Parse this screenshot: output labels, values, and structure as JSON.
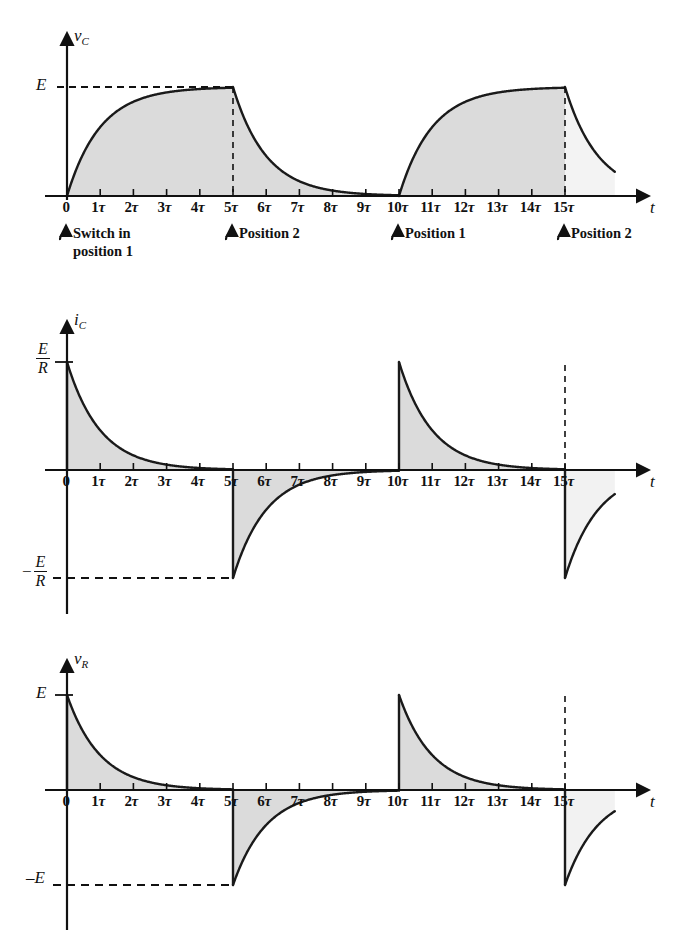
{
  "figure": {
    "title": "",
    "colors": {
      "curve": "#1a1a1a",
      "axis": "#111111",
      "fill": "#d9d9d9",
      "fill_light": "#e8e8e8",
      "dashed": "#111111"
    },
    "tau_labels": [
      "0",
      "1τ",
      "2τ",
      "3τ",
      "4τ",
      "5τ",
      "6τ",
      "7τ",
      "8τ",
      "9τ",
      "10τ",
      "11τ",
      "12τ",
      "13τ",
      "14τ",
      "15τ"
    ],
    "time_axis_label": "t"
  },
  "panels": [
    {
      "id": "vc",
      "y_axis_label": "v",
      "y_axis_sub": "C",
      "y_levels": [
        {
          "label": "E",
          "value": 1.0
        }
      ],
      "x_tick_labels": [
        "0",
        "1τ",
        "2τ",
        "3τ",
        "4τ",
        "5τ",
        "6τ",
        "7τ",
        "8τ",
        "9τ",
        "10τ",
        "11τ",
        "12τ",
        "13τ",
        "14τ",
        "15τ"
      ],
      "x_axis_label": "t",
      "annotations": [
        {
          "at_tau": 0,
          "line1": "Switch in",
          "line2": "position 1"
        },
        {
          "at_tau": 5,
          "line1": "Position 2",
          "line2": ""
        },
        {
          "at_tau": 10,
          "line1": "Position 1",
          "line2": ""
        },
        {
          "at_tau": 15,
          "line1": "Position 2",
          "line2": ""
        }
      ]
    },
    {
      "id": "ic",
      "y_axis_label": "i",
      "y_axis_sub": "C",
      "y_levels": [
        {
          "label_num": "E",
          "label_den": "R",
          "sign": "",
          "value": 1.0
        },
        {
          "label_num": "E",
          "label_den": "R",
          "sign": "−",
          "value": -1.0
        }
      ],
      "x_tick_labels": [
        "0",
        "1τ",
        "2τ",
        "3τ",
        "4τ",
        "5τ",
        "6τ",
        "7τ",
        "8τ",
        "9τ",
        "10τ",
        "11τ",
        "12τ",
        "13τ",
        "14τ",
        "15τ"
      ],
      "x_axis_label": "t",
      "annotations": []
    },
    {
      "id": "vr",
      "y_axis_label": "v",
      "y_axis_sub": "R",
      "y_levels": [
        {
          "label": "E",
          "value": 1.0
        },
        {
          "label": "–E",
          "value": -1.0
        }
      ],
      "x_tick_labels": [
        "0",
        "1τ",
        "2τ",
        "3τ",
        "4τ",
        "5τ",
        "6τ",
        "7τ",
        "8τ",
        "9τ",
        "10τ",
        "11τ",
        "12τ",
        "13τ",
        "14τ",
        "15τ"
      ],
      "x_axis_label": "t",
      "annotations": []
    }
  ],
  "chart_data": {
    "type": "line",
    "xlabel": "t",
    "x_unit": "tau",
    "xlim": [
      -0.6,
      17.5
    ],
    "grid": false,
    "legend": "none",
    "x_ticks": [
      0,
      1,
      2,
      3,
      4,
      5,
      6,
      7,
      8,
      9,
      10,
      11,
      12,
      13,
      14,
      15
    ],
    "x_tick_labels": [
      "0",
      "1τ",
      "2τ",
      "3τ",
      "4τ",
      "5τ",
      "6τ",
      "7τ",
      "8τ",
      "9τ",
      "10τ",
      "11τ",
      "12τ",
      "13τ",
      "14τ",
      "15τ"
    ],
    "series": [
      {
        "name": "v_C",
        "ylabel": "v_C",
        "ylim": [
          0,
          1.08
        ],
        "y_tick_labels": [
          "E"
        ],
        "y_ticks": [
          1.0
        ],
        "segments": [
          {
            "range_tau": [
              0,
              5
            ],
            "formula": "E*(1-exp(-t/tau))",
            "start_value": 0.0,
            "end_value": 1.0
          },
          {
            "range_tau": [
              5,
              10
            ],
            "formula": "E*exp(-(t-5)/tau)",
            "start_value": 1.0,
            "end_value": 0.0
          },
          {
            "range_tau": [
              10,
              15
            ],
            "formula": "E*(1-exp(-(t-10)/tau))",
            "start_value": 0.0,
            "end_value": 1.0
          },
          {
            "range_tau": [
              15,
              16.5
            ],
            "formula": "E*exp(-(t-15)/tau)",
            "start_value": 1.0,
            "end_value": 0.22
          }
        ],
        "sample_points": [
          {
            "t": 0,
            "v": 0.0
          },
          {
            "t": 1,
            "v": 0.632
          },
          {
            "t": 2,
            "v": 0.865
          },
          {
            "t": 3,
            "v": 0.95
          },
          {
            "t": 4,
            "v": 0.982
          },
          {
            "t": 5,
            "v": 1.0
          },
          {
            "t": 6,
            "v": 0.368
          },
          {
            "t": 7,
            "v": 0.135
          },
          {
            "t": 8,
            "v": 0.05
          },
          {
            "t": 9,
            "v": 0.018
          },
          {
            "t": 10,
            "v": 0.0
          },
          {
            "t": 11,
            "v": 0.632
          },
          {
            "t": 12,
            "v": 0.865
          },
          {
            "t": 13,
            "v": 0.95
          },
          {
            "t": 14,
            "v": 0.982
          },
          {
            "t": 15,
            "v": 1.0
          },
          {
            "t": 16,
            "v": 0.368
          }
        ]
      },
      {
        "name": "i_C",
        "ylabel": "i_C",
        "ylim": [
          -1.08,
          1.08
        ],
        "y_tick_labels": [
          "E/R",
          "-E/R"
        ],
        "y_ticks": [
          1.0,
          -1.0
        ],
        "segments": [
          {
            "range_tau": [
              0,
              5
            ],
            "formula": "(E/R)*exp(-t/tau)",
            "start_value": 1.0,
            "end_value": 0.0
          },
          {
            "range_tau": [
              5,
              10
            ],
            "formula": "-(E/R)*exp(-(t-5)/tau)",
            "start_value": -1.0,
            "end_value": 0.0
          },
          {
            "range_tau": [
              10,
              15
            ],
            "formula": "(E/R)*exp(-(t-10)/tau)",
            "start_value": 1.0,
            "end_value": 0.0
          },
          {
            "range_tau": [
              15,
              16.5
            ],
            "formula": "-(E/R)*exp(-(t-15)/tau)",
            "start_value": -1.0,
            "end_value": -0.22
          }
        ],
        "sample_points": [
          {
            "t": 0,
            "v": 1.0
          },
          {
            "t": 1,
            "v": 0.368
          },
          {
            "t": 2,
            "v": 0.135
          },
          {
            "t": 3,
            "v": 0.05
          },
          {
            "t": 4,
            "v": 0.018
          },
          {
            "t": 5,
            "v": -1.0
          },
          {
            "t": 6,
            "v": -0.368
          },
          {
            "t": 7,
            "v": -0.135
          },
          {
            "t": 8,
            "v": -0.05
          },
          {
            "t": 9,
            "v": -0.018
          },
          {
            "t": 10,
            "v": 1.0
          },
          {
            "t": 11,
            "v": 0.368
          },
          {
            "t": 12,
            "v": 0.135
          },
          {
            "t": 13,
            "v": 0.05
          },
          {
            "t": 14,
            "v": 0.018
          },
          {
            "t": 15,
            "v": -1.0
          },
          {
            "t": 16,
            "v": -0.368
          }
        ]
      },
      {
        "name": "v_R",
        "ylabel": "v_R",
        "ylim": [
          -1.08,
          1.08
        ],
        "y_tick_labels": [
          "E",
          "-E"
        ],
        "y_ticks": [
          1.0,
          -1.0
        ],
        "segments": [
          {
            "range_tau": [
              0,
              5
            ],
            "formula": "E*exp(-t/tau)",
            "start_value": 1.0,
            "end_value": 0.0
          },
          {
            "range_tau": [
              5,
              10
            ],
            "formula": "-E*exp(-(t-5)/tau)",
            "start_value": -1.0,
            "end_value": 0.0
          },
          {
            "range_tau": [
              10,
              15
            ],
            "formula": "E*exp(-(t-10)/tau)",
            "start_value": 1.0,
            "end_value": 0.0
          },
          {
            "range_tau": [
              15,
              16.5
            ],
            "formula": "-E*exp(-(t-15)/tau)",
            "start_value": -1.0,
            "end_value": -0.22
          }
        ],
        "sample_points": [
          {
            "t": 0,
            "v": 1.0
          },
          {
            "t": 1,
            "v": 0.368
          },
          {
            "t": 2,
            "v": 0.135
          },
          {
            "t": 3,
            "v": 0.05
          },
          {
            "t": 4,
            "v": 0.018
          },
          {
            "t": 5,
            "v": -1.0
          },
          {
            "t": 6,
            "v": -0.368
          },
          {
            "t": 7,
            "v": -0.135
          },
          {
            "t": 8,
            "v": -0.05
          },
          {
            "t": 9,
            "v": -0.018
          },
          {
            "t": 10,
            "v": 1.0
          },
          {
            "t": 11,
            "v": 0.368
          },
          {
            "t": 12,
            "v": 0.135
          },
          {
            "t": 13,
            "v": 0.05
          },
          {
            "t": 14,
            "v": 0.018
          },
          {
            "t": 15,
            "v": -1.0
          },
          {
            "t": 16,
            "v": -0.368
          }
        ]
      }
    ],
    "annotations": [
      {
        "at_tau": 0,
        "text": "Switch in position 1",
        "panel": "v_C"
      },
      {
        "at_tau": 5,
        "text": "Position 2",
        "panel": "v_C"
      },
      {
        "at_tau": 10,
        "text": "Position 1",
        "panel": "v_C"
      },
      {
        "at_tau": 15,
        "text": "Position 2",
        "panel": "v_C"
      }
    ]
  }
}
